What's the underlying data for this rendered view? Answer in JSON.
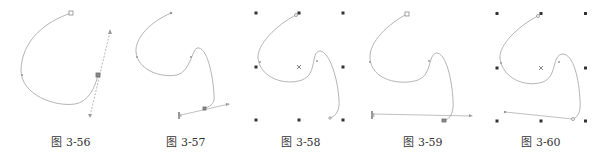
{
  "figures": [
    {
      "id": "fig-3-56",
      "caption": "图 3-56",
      "caption_x": 71
    },
    {
      "id": "fig-3-57",
      "caption": "图 3-57",
      "caption_x": 186
    },
    {
      "id": "fig-3-58",
      "caption": "图 3-58",
      "caption_x": 301
    },
    {
      "id": "fig-3-59",
      "caption": "图 3-59",
      "caption_x": 423
    },
    {
      "id": "fig-3-60",
      "caption": "图 3-60",
      "caption_x": 541
    }
  ],
  "colors": {
    "curve": "#b5b5b5",
    "node": "#8a8a8a",
    "grid_handle": "#333333",
    "caption": "#333333"
  }
}
